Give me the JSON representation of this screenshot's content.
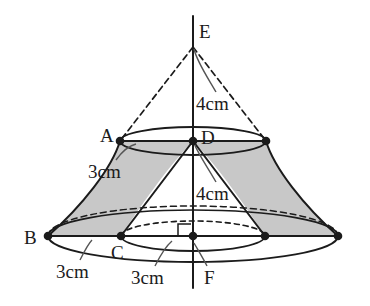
{
  "figure": {
    "background_color": "#ffffff",
    "stroke_color": "#1b1b1b",
    "shade_color": "#c8c8c8",
    "vertex_labels": [
      {
        "id": "E",
        "text": "E",
        "x": 199,
        "y": 22
      },
      {
        "id": "A",
        "text": "A",
        "x": 100,
        "y": 126
      },
      {
        "id": "D",
        "text": "D",
        "x": 201,
        "y": 128
      },
      {
        "id": "B",
        "text": "B",
        "x": 24,
        "y": 228
      },
      {
        "id": "C",
        "text": "C",
        "x": 111,
        "y": 243
      },
      {
        "id": "F",
        "text": "F",
        "x": 204,
        "y": 268
      }
    ],
    "dimension_labels": [
      {
        "id": "upper-height",
        "text": "4cm",
        "x": 196,
        "y": 94
      },
      {
        "id": "top-radius",
        "text": "3cm",
        "x": 88,
        "y": 162
      },
      {
        "id": "lower-height",
        "text": "4cm",
        "x": 196,
        "y": 184
      },
      {
        "id": "bottom-outer-radius",
        "text": "3cm",
        "x": 56,
        "y": 262
      },
      {
        "id": "bottom-inner-radius",
        "text": "3cm",
        "x": 131,
        "y": 268
      }
    ],
    "measurements": {
      "upper_cone_height": "4cm",
      "lower_cone_height": "4cm",
      "top_circle_radius": "3cm",
      "bottom_inner_radius": "3cm",
      "bottom_outer_radius": "3cm"
    },
    "points": {
      "E": {
        "x": 193,
        "y": 47
      },
      "A": {
        "x": 120,
        "y": 141
      },
      "D": {
        "x": 193,
        "y": 141
      },
      "top_right": {
        "x": 266,
        "y": 141
      },
      "B": {
        "x": 48,
        "y": 236
      },
      "C": {
        "x": 121,
        "y": 236
      },
      "F": {
        "x": 193,
        "y": 236
      },
      "bottom_inner_right": {
        "x": 265,
        "y": 236
      },
      "bottom_outer_right": {
        "x": 338,
        "y": 236
      }
    },
    "axis": {
      "x": 193,
      "top_y": 16,
      "bottom_y": 288
    }
  }
}
